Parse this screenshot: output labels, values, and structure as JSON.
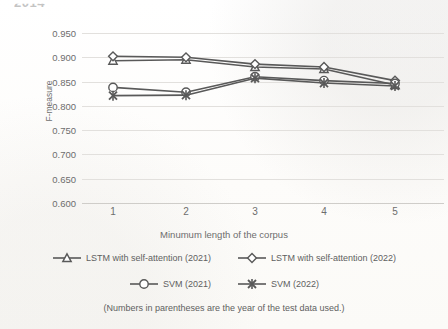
{
  "top_cropped_text": "2014",
  "footnote": "(Numbers in parentheses are the year of the test data used.)",
  "axes": {
    "ylabel": "F-measure",
    "xlabel": "Minumum length of the corpus",
    "yticks": [
      "0.950",
      "0.900",
      "0.850",
      "0.800",
      "0.750",
      "0.700",
      "0.650",
      "0.600"
    ],
    "xticks": [
      "1",
      "2",
      "3",
      "4",
      "5"
    ]
  },
  "legend": {
    "rows": [
      [
        {
          "label": "LSTM with self-attention (2021)",
          "marker": "triangle-marker",
          "name": "legend-item-lstm-2021"
        },
        {
          "label": "LSTM with self-attention (2022)",
          "marker": "diamond-marker",
          "name": "legend-item-lstm-2022"
        }
      ],
      [
        {
          "label": "SVM (2021)",
          "marker": "circle-marker",
          "name": "legend-item-svm-2021"
        },
        {
          "label": "SVM (2022)",
          "marker": "x-marker",
          "name": "legend-item-svm-2022"
        }
      ]
    ]
  },
  "chart_data": {
    "type": "line",
    "title": "",
    "xlabel": "Minumum length of the corpus",
    "ylabel": "F-measure",
    "x": [
      1,
      2,
      3,
      4,
      5
    ],
    "ylim": [
      0.6,
      0.95
    ],
    "ytick_step": 0.05,
    "grid": true,
    "legend_position": "bottom",
    "colors": {
      "line": "#595959",
      "grid": "#e2e0dd",
      "text": "#6d6d6d"
    },
    "series": [
      {
        "name": "LSTM with self-attention (2021)",
        "marker": "triangle",
        "values": [
          0.893,
          0.895,
          0.88,
          0.876,
          0.843
        ]
      },
      {
        "name": "LSTM with self-attention (2022)",
        "marker": "diamond",
        "values": [
          0.902,
          0.9,
          0.886,
          0.88,
          0.852
        ]
      },
      {
        "name": "SVM (2021)",
        "marker": "circle",
        "values": [
          0.838,
          0.828,
          0.86,
          0.852,
          0.846
        ]
      },
      {
        "name": "SVM (2022)",
        "marker": "x",
        "values": [
          0.821,
          0.822,
          0.857,
          0.847,
          0.841
        ]
      }
    ]
  }
}
